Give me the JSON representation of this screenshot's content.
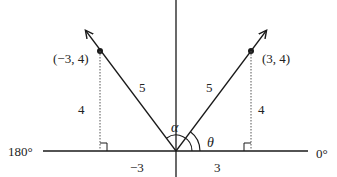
{
  "diagram": {
    "title": "",
    "points": [
      {
        "label": "(−3, 4)",
        "x": -3,
        "y": 4
      },
      {
        "label": "(3, 4)",
        "x": 3,
        "y": 4
      }
    ],
    "segment_labels": {
      "left_hypotenuse": "5",
      "right_hypotenuse": "5",
      "left_height": "4",
      "right_height": "4",
      "left_base": "−3",
      "right_base": "3"
    },
    "angle_labels": {
      "alpha": "α",
      "theta": "θ"
    },
    "axis_labels": {
      "left_end": "180°",
      "right_end": "0°"
    },
    "colors": {
      "line": "#1a1a1a",
      "dotted": "#555555",
      "background": "#ffffff"
    }
  }
}
